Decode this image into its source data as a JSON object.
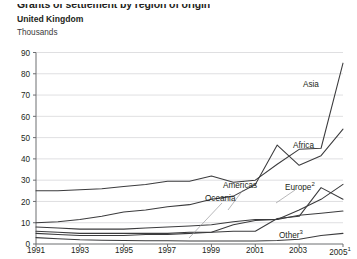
{
  "header": {
    "title": "Grants of settlement by region of origin",
    "subtitle": "United Kingdom",
    "units": "Thousands"
  },
  "axis": {
    "y_ticks": [
      "0",
      "10",
      "20",
      "30",
      "40",
      "50",
      "60",
      "70",
      "80",
      "90"
    ],
    "x_ticks": [
      "1991",
      "1993",
      "1995",
      "1997",
      "1999",
      "2001",
      "2003",
      "2005"
    ],
    "x_last_superscript": "1"
  },
  "series_labels": {
    "asia": "Asia",
    "africa": "Africa",
    "americas": "Americas",
    "europe": "Europe",
    "europe_sup": "2",
    "oceania": "Oceania",
    "other": "Other",
    "other_sup": "3"
  },
  "colors": {
    "line": "#58595b",
    "line_dark": "#3b3b3d",
    "grid": "#d7d7d9",
    "axis": "#6d6e71",
    "text": "#231f20",
    "background": "#ffffff"
  },
  "chart_data": {
    "type": "line",
    "title": "Grants of settlement by region of origin",
    "subtitle": "United Kingdom",
    "xlabel": "",
    "ylabel": "Thousands",
    "ylim": [
      0,
      90
    ],
    "ytick_step": 10,
    "grid": true,
    "legend": "inline-annotations",
    "x": [
      1991,
      1992,
      1993,
      1994,
      1995,
      1996,
      1997,
      1998,
      1999,
      2000,
      2001,
      2002,
      2003,
      2004,
      2005
    ],
    "series": [
      {
        "name": "Asia",
        "values": [
          25,
          25,
          25.5,
          26,
          27,
          28,
          29.5,
          29.5,
          32,
          29,
          30,
          37.5,
          44.5,
          45,
          85
        ]
      },
      {
        "name": "Africa",
        "values": [
          10,
          10.5,
          11.5,
          13,
          15,
          16,
          17.5,
          18.5,
          21,
          22.5,
          28,
          46.5,
          37,
          41.5,
          54
        ]
      },
      {
        "name": "Americas",
        "values": [
          8,
          7.5,
          7,
          7,
          7,
          7.5,
          8,
          8.5,
          9,
          10.5,
          11.5,
          11.5,
          16,
          21,
          28
        ]
      },
      {
        "name": "Europe",
        "values": [
          6,
          5.5,
          5,
          5,
          5,
          5,
          5,
          5.5,
          5.5,
          6,
          6,
          12,
          13,
          26.5,
          21
        ]
      },
      {
        "name": "Oceania",
        "values": [
          5,
          4.5,
          4,
          4,
          4,
          4.5,
          4.5,
          5,
          5.5,
          9,
          11,
          11.5,
          13.5,
          14.5,
          15.5
        ]
      },
      {
        "name": "Other",
        "values": [
          3,
          2.5,
          2,
          1.8,
          1.6,
          1.5,
          1.5,
          1.4,
          1.4,
          1.4,
          1.4,
          1.6,
          2.2,
          4,
          5
        ]
      }
    ]
  }
}
